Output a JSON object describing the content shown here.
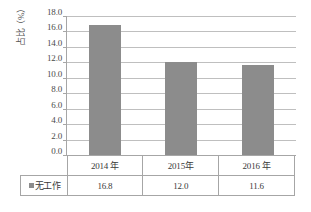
{
  "chart_data": {
    "type": "bar",
    "title": "",
    "xlabel": "",
    "ylabel": "占比（%）",
    "categories": [
      "2014 年",
      "2015年",
      "2016 年"
    ],
    "series": [
      {
        "name": "无工作",
        "values": [
          16.8,
          12.0,
          11.6
        ],
        "color": "#8c8c8c"
      }
    ],
    "value_labels": [
      "16.8",
      "12.0",
      "11.6"
    ],
    "ylim": [
      0.0,
      18.0
    ],
    "ytick_step": 2.0,
    "ytick_labels": [
      "18.0",
      "16.0",
      "14.0",
      "12.0",
      "10.0",
      "8.0",
      "6.0",
      "4.0",
      "2.0",
      "0.0"
    ],
    "grid": true,
    "legend_position": "data-table-row",
    "legend_marker": "square-swatch",
    "has_data_table": true
  },
  "table": {
    "legend_label": "无工作"
  },
  "colors": {
    "bar": "#8c8c8c",
    "gridline": "#bfbfbf",
    "axis": "#a6a6a6",
    "text": "#3a3a3a",
    "background": "#ffffff"
  }
}
